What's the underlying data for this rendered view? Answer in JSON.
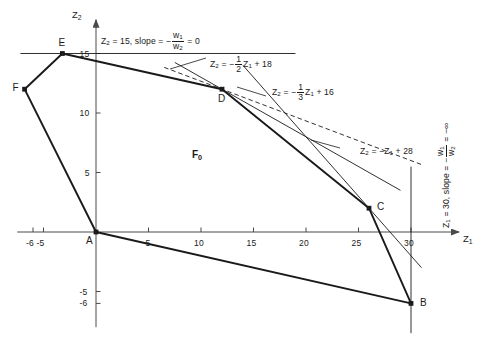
{
  "figure": {
    "region_label": "F",
    "region_label_sub": "0",
    "background_color": "#ffffff",
    "line_color": "#1a1a1a",
    "axis_color": "#4a4a4a"
  },
  "axes": {
    "x": {
      "name": "Z",
      "sub": "1",
      "ticks": [
        "-6",
        "-5",
        "5",
        "10",
        "15",
        "20",
        "25",
        "30"
      ],
      "tick_values": [
        -6,
        -5,
        5,
        10,
        15,
        20,
        25,
        30
      ],
      "min": -7.5,
      "max": 34
    },
    "y": {
      "name": "Z",
      "sub": "2",
      "ticks": [
        "15",
        "10",
        "5",
        "-5",
        "-6"
      ],
      "tick_values": [
        15,
        10,
        5,
        -5,
        -6
      ],
      "min": -8,
      "max": 17.5
    }
  },
  "vertices": [
    {
      "label": "A",
      "z1": 0,
      "z2": 0
    },
    {
      "label": "B",
      "z1": 30,
      "z2": -6
    },
    {
      "label": "C",
      "z1": 26,
      "z2": 2
    },
    {
      "label": "D",
      "z1": 12,
      "z2": 12
    },
    {
      "label": "E",
      "z1": -3.2,
      "z2": 15
    },
    {
      "label": "F",
      "z1": -6.8,
      "z2": 12
    }
  ],
  "annotations": [
    {
      "id": "z2-15",
      "text_parts": [
        "Z",
        "2",
        " = 15, slope = −",
        "w",
        "1",
        "w",
        "2",
        " = 0"
      ],
      "plain": "Z2 = 15, slope = -w1/w2 = 0"
    },
    {
      "id": "half-line",
      "plain": "Z2 = -1/2 Z1 + 18",
      "slope": -0.5,
      "intercept": 18,
      "constant": "18"
    },
    {
      "id": "third-line",
      "plain": "Z2 = -1/3 Z1 + 16",
      "slope": -0.3333,
      "intercept": 16,
      "constant": "16"
    },
    {
      "id": "unit-line",
      "plain": "Z2 = -Z1 + 28",
      "slope": -1,
      "intercept": 28,
      "constant": "28"
    },
    {
      "id": "z1-30",
      "plain": "Z1 = 30, slope = -w1/w2 = -∞",
      "constant": "30"
    }
  ],
  "chart_data": {
    "type": "line",
    "xlabel": "Z1",
    "ylabel": "Z2",
    "xlim": [
      -7.5,
      34
    ],
    "ylim": [
      -8,
      17.5
    ],
    "grid": false,
    "legend": "none",
    "xticks": [
      -6,
      -5,
      5,
      10,
      15,
      20,
      25,
      30
    ],
    "yticks": [
      15,
      10,
      5,
      -5,
      -6
    ],
    "polygon": {
      "name": "F0",
      "closed": true,
      "vertices": [
        {
          "label": "A",
          "x": 0,
          "y": 0
        },
        {
          "label": "B",
          "x": 30,
          "y": -6
        },
        {
          "label": "C",
          "x": 26,
          "y": 2
        },
        {
          "label": "D",
          "x": 12,
          "y": 12
        },
        {
          "label": "E",
          "x": -3.2,
          "y": 15
        },
        {
          "label": "F",
          "x": -6.8,
          "y": 12
        }
      ]
    },
    "series": [
      {
        "name": "Z2 = 15",
        "style": "solid-thin",
        "slope": 0,
        "intercept": 15,
        "x_range": [
          -7.2,
          19
        ]
      },
      {
        "name": "Z2 = -1/2 Z1 + 18",
        "style": "solid-thin",
        "slope": -0.5,
        "intercept": 18,
        "x_range": [
          7.5,
          29
        ]
      },
      {
        "name": "Z2 = -1/3 Z1 + 16",
        "style": "dashed",
        "slope": -0.3333,
        "intercept": 16,
        "x_range": [
          6.5,
          31
        ]
      },
      {
        "name": "Z2 = -Z1 + 28",
        "style": "solid-thin",
        "slope": -1,
        "intercept": 28,
        "x_range": [
          14,
          31
        ]
      },
      {
        "name": "Z1 = 30",
        "style": "solid-thin",
        "vertical_at": 30,
        "y_range": [
          -8.5,
          5.5
        ]
      }
    ]
  }
}
